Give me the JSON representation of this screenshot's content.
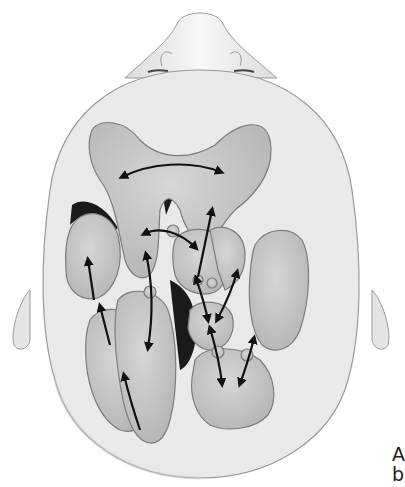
{
  "figure": {
    "colors": {
      "background": "#ffffff",
      "head_fill": "#e9e9e9",
      "head_outline": "#9a9a9a",
      "organ_fill": "#c9c9c9",
      "organ_outline": "#7d7d7d",
      "dark_region": "#1a1a1a",
      "arrow": "#111111"
    },
    "arrow_count": 14
  },
  "caption": {
    "line1": "A",
    "line2": "b"
  }
}
